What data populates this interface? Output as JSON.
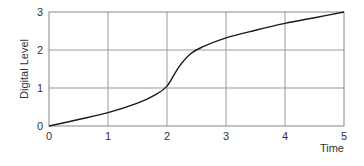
{
  "chart_data": {
    "type": "line",
    "title": "",
    "xlabel": "Time",
    "ylabel": "Digital Level",
    "xlim": [
      0,
      5
    ],
    "ylim": [
      0,
      3
    ],
    "xticks": [
      0,
      1,
      2,
      3,
      4,
      5
    ],
    "yticks": [
      0,
      1,
      2,
      3
    ],
    "xtick_labels": [
      "0",
      "1",
      "2",
      "3",
      "4",
      "5"
    ],
    "ytick_labels": [
      "0",
      "1",
      "2",
      "3"
    ],
    "grid": true,
    "legend": null,
    "series": [
      {
        "name": "Digital Level",
        "color": "#1a1a1a",
        "x": [
          0,
          0.5,
          1,
          1.5,
          1.8,
          2.0,
          2.2,
          2.4,
          2.6,
          3,
          3.5,
          4,
          4.5,
          5
        ],
        "y": [
          0,
          0.17,
          0.35,
          0.6,
          0.82,
          1.05,
          1.55,
          1.9,
          2.08,
          2.32,
          2.52,
          2.7,
          2.85,
          3.0
        ]
      }
    ]
  }
}
